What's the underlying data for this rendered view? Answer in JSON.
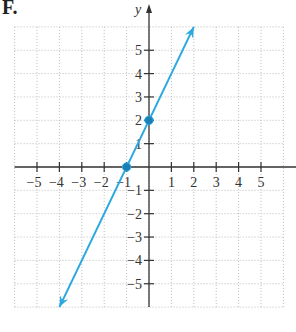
{
  "part_label": "F.",
  "chart_data": {
    "type": "line",
    "title": "",
    "xlabel": "x",
    "ylabel": "y",
    "xlim": [
      -6,
      6
    ],
    "ylim": [
      -6,
      6
    ],
    "grid": true,
    "x_ticks": [
      -5,
      -4,
      -3,
      -2,
      -1,
      1,
      2,
      3,
      4,
      5
    ],
    "y_ticks": [
      -5,
      -4,
      -3,
      -2,
      -1,
      1,
      2,
      3,
      4,
      5
    ],
    "series": [
      {
        "name": "y = 2x + 2",
        "equation": "y = 2x + 2",
        "color": "#2aa8e0",
        "endpoints": [
          [
            -4,
            -6
          ],
          [
            2,
            6
          ]
        ],
        "arrows_both_ends": true,
        "marked_points": [
          [
            -1,
            0
          ],
          [
            0,
            2
          ]
        ]
      }
    ]
  },
  "colors": {
    "axis": "#333333",
    "grid": "#bbbbbb",
    "line": "#2aa8e0"
  }
}
